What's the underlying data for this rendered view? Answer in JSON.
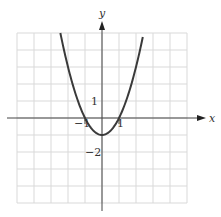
{
  "chart_data": {
    "type": "line",
    "title": "",
    "xlabel": "x",
    "ylabel": "y",
    "xlim": [
      -5,
      5
    ],
    "ylim": [
      -5,
      5
    ],
    "grid": true,
    "function": "y = x^2 - 1",
    "series": [
      {
        "name": "parabola",
        "x": [
          -2.45,
          -2,
          -1.5,
          -1,
          -0.5,
          0,
          0.5,
          1,
          1.5,
          2,
          2.45
        ],
        "y": [
          5.0,
          3,
          1.25,
          0,
          -0.75,
          -1,
          -0.75,
          0,
          1.25,
          3,
          5.0
        ]
      }
    ],
    "annotations": [
      {
        "text": "1",
        "at": "y-axis tick y=1"
      },
      {
        "text": "−1",
        "at": "x-axis tick x=-1"
      },
      {
        "text": "1",
        "at": "x-axis tick x=1"
      },
      {
        "text": "−2",
        "at": "y-axis tick y=-2"
      }
    ]
  },
  "labels": {
    "x_axis": "x",
    "y_axis": "y",
    "y_tick_1": "1",
    "x_tick_neg1": "−1",
    "x_tick_1": "1",
    "y_tick_neg2": "−2"
  },
  "colors": {
    "grid": "#d9d9d9",
    "axis": "#444444",
    "curve": "#3a3a3a"
  }
}
